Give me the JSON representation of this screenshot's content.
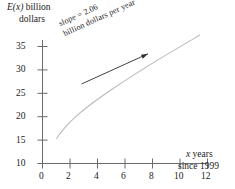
{
  "figure": {
    "background_color": "#ffffff",
    "axis_color": "#6b6b6b",
    "curve_color": "#b9b9b9",
    "annotation_color": "#2e2e2e"
  },
  "labels": {
    "y_axis_line1": "E(x) billion",
    "y_axis_line2": "dollars",
    "y_axis_italic_part": "E(x)",
    "x_axis_line1": "x years",
    "x_axis_line2": "since 1999",
    "x_axis_italic_part": "x",
    "annotation_line1": "slope = 2.06",
    "annotation_line2": "billion dollars per year"
  },
  "chart_data": {
    "type": "line",
    "title": "",
    "subtitle": "",
    "xlabel": "x years since 1999",
    "ylabel": "E(x) billion dollars",
    "xlim": [
      0,
      12
    ],
    "ylim": [
      10,
      35
    ],
    "x_ticks": [
      0,
      2,
      4,
      6,
      8,
      10,
      12
    ],
    "y_ticks": [
      10,
      15,
      20,
      25,
      30,
      35
    ],
    "x_tick_labels": [
      "0",
      "2",
      "4",
      "6",
      "8",
      "10",
      "12"
    ],
    "y_tick_labels": [
      "10",
      "15",
      "20",
      "25",
      "30",
      "35"
    ],
    "grid": false,
    "legend": false,
    "legend_position": "none",
    "series": [
      {
        "name": "E(x)",
        "color": "#b9b9b9",
        "x": [
          1,
          1.5,
          2,
          2.5,
          3,
          3.5,
          4,
          5,
          6,
          7,
          8,
          9,
          10,
          11,
          11.5
        ],
        "y": [
          15.3,
          16.9,
          18.3,
          19.5,
          20.6,
          21.5,
          22.3,
          23.9,
          25.4,
          26.9,
          28.3,
          29.7,
          31.0,
          32.8,
          33.8
        ]
      }
    ],
    "annotations": [
      {
        "text": "slope = 2.06 billion dollars per year",
        "type": "arrow",
        "rotation_deg": -24.5,
        "arrow_from": [
          2.9,
          16.0
        ],
        "arrow_to": [
          7.9,
          23.5
        ]
      }
    ]
  }
}
